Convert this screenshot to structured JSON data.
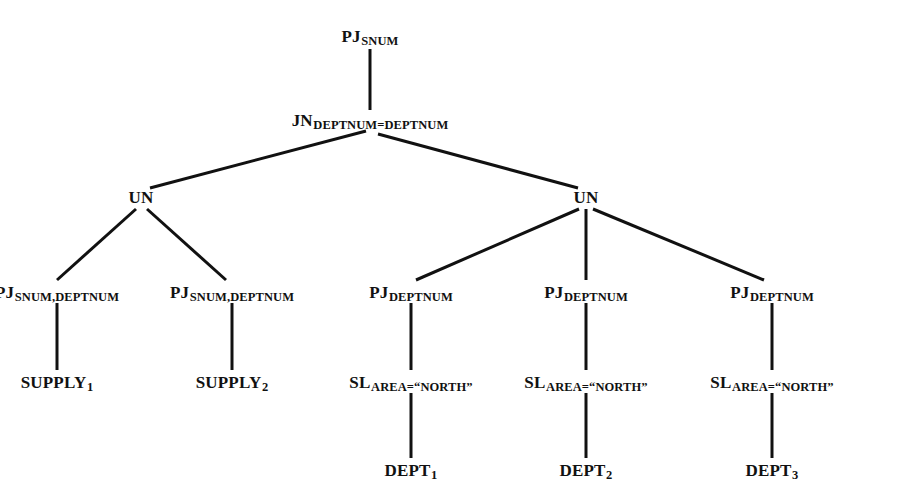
{
  "diagram": {
    "type": "query-tree",
    "background_color": "#ffffff",
    "line_color": "#111111",
    "text_color": "#111111",
    "line_width": 3,
    "nodes": [
      {
        "id": "pj_root",
        "op": "PJ",
        "sub": "SNUM",
        "index": "",
        "x": 370,
        "y": 36,
        "anchor": "center"
      },
      {
        "id": "jn",
        "op": "JN",
        "sub": "DEPTNUM=DEPTNUM",
        "index": "",
        "x": 370,
        "y": 120,
        "anchor": "center"
      },
      {
        "id": "un_left",
        "op": "UN",
        "sub": "",
        "index": "",
        "x": 141,
        "y": 197,
        "anchor": "center"
      },
      {
        "id": "un_right",
        "op": "UN",
        "sub": "",
        "index": "",
        "x": 586,
        "y": 197,
        "anchor": "center"
      },
      {
        "id": "pj_l1",
        "op": "PJ",
        "sub": "SNUM,DEPTNUM",
        "index": "",
        "x": 57,
        "y": 292,
        "anchor": "center"
      },
      {
        "id": "pj_l2",
        "op": "PJ",
        "sub": "SNUM,DEPTNUM",
        "index": "",
        "x": 232,
        "y": 292,
        "anchor": "center"
      },
      {
        "id": "pj_r1",
        "op": "PJ",
        "sub": "DEPTNUM",
        "index": "",
        "x": 411,
        "y": 292,
        "anchor": "center"
      },
      {
        "id": "pj_r2",
        "op": "PJ",
        "sub": "DEPTNUM",
        "index": "",
        "x": 586,
        "y": 292,
        "anchor": "center"
      },
      {
        "id": "pj_r3",
        "op": "PJ",
        "sub": "DEPTNUM",
        "index": "",
        "x": 772,
        "y": 292,
        "anchor": "center"
      },
      {
        "id": "supply_1",
        "op": "SUPPLY",
        "sub": "",
        "index": "1",
        "x": 57,
        "y": 382,
        "anchor": "center"
      },
      {
        "id": "supply_2",
        "op": "SUPPLY",
        "sub": "",
        "index": "2",
        "x": 232,
        "y": 382,
        "anchor": "center"
      },
      {
        "id": "sl_1",
        "op": "SL",
        "sub": "AREA=“NORTH”",
        "index": "",
        "x": 411,
        "y": 382,
        "anchor": "center"
      },
      {
        "id": "sl_2",
        "op": "SL",
        "sub": "AREA=“NORTH”",
        "index": "",
        "x": 586,
        "y": 382,
        "anchor": "center"
      },
      {
        "id": "sl_3",
        "op": "SL",
        "sub": "AREA=“NORTH”",
        "index": "",
        "x": 772,
        "y": 382,
        "anchor": "center"
      },
      {
        "id": "dept_1",
        "op": "DEPT",
        "sub": "",
        "index": "1",
        "x": 411,
        "y": 470,
        "anchor": "center"
      },
      {
        "id": "dept_2",
        "op": "DEPT",
        "sub": "",
        "index": "2",
        "x": 586,
        "y": 470,
        "anchor": "center"
      },
      {
        "id": "dept_3",
        "op": "DEPT",
        "sub": "",
        "index": "3",
        "x": 772,
        "y": 470,
        "anchor": "center"
      }
    ],
    "edges": [
      {
        "from": "pj_root",
        "to": "jn",
        "x1": 370,
        "y1": 49,
        "x2": 370,
        "y2": 110
      },
      {
        "from": "jn",
        "to": "un_left",
        "x1": 366,
        "y1": 131,
        "x2": 150,
        "y2": 188
      },
      {
        "from": "jn",
        "to": "un_right",
        "x1": 378,
        "y1": 134,
        "x2": 578,
        "y2": 188
      },
      {
        "from": "un_left",
        "to": "pj_l1",
        "x1": 136,
        "y1": 209,
        "x2": 57,
        "y2": 280
      },
      {
        "from": "un_left",
        "to": "pj_l2",
        "x1": 147,
        "y1": 209,
        "x2": 226,
        "y2": 280
      },
      {
        "from": "un_right",
        "to": "pj_r1",
        "x1": 579,
        "y1": 209,
        "x2": 416,
        "y2": 280
      },
      {
        "from": "un_right",
        "to": "pj_r2",
        "x1": 586,
        "y1": 209,
        "x2": 586,
        "y2": 280
      },
      {
        "from": "un_right",
        "to": "pj_r3",
        "x1": 593,
        "y1": 209,
        "x2": 764,
        "y2": 280
      },
      {
        "from": "pj_l1",
        "to": "supply_1",
        "x1": 57,
        "y1": 303,
        "x2": 57,
        "y2": 370
      },
      {
        "from": "pj_l2",
        "to": "supply_2",
        "x1": 232,
        "y1": 303,
        "x2": 232,
        "y2": 370
      },
      {
        "from": "pj_r1",
        "to": "sl_1",
        "x1": 411,
        "y1": 303,
        "x2": 411,
        "y2": 370
      },
      {
        "from": "pj_r2",
        "to": "sl_2",
        "x1": 586,
        "y1": 303,
        "x2": 586,
        "y2": 370
      },
      {
        "from": "pj_r3",
        "to": "sl_3",
        "x1": 772,
        "y1": 303,
        "x2": 772,
        "y2": 370
      },
      {
        "from": "sl_1",
        "to": "dept_1",
        "x1": 411,
        "y1": 393,
        "x2": 411,
        "y2": 458
      },
      {
        "from": "sl_2",
        "to": "dept_2",
        "x1": 586,
        "y1": 393,
        "x2": 586,
        "y2": 458
      },
      {
        "from": "sl_3",
        "to": "dept_3",
        "x1": 772,
        "y1": 393,
        "x2": 772,
        "y2": 458
      }
    ]
  }
}
